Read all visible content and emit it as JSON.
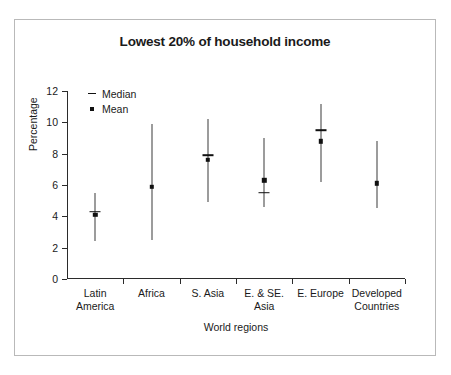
{
  "chart_data": {
    "type": "scatter",
    "title": "Lowest 20% of household income",
    "xlabel": "World regions",
    "ylabel": "Percentage",
    "ylim": [
      0,
      12
    ],
    "yticks": [
      0,
      2,
      4,
      6,
      8,
      10,
      12
    ],
    "grid": false,
    "legend_position": "top-left",
    "legend": [
      {
        "key": "dash",
        "label": "Median"
      },
      {
        "key": "dot",
        "label": "Mean"
      }
    ],
    "categories": [
      "Latin\nAmerica",
      "Africa",
      "S. Asia",
      "E. & SE.\nAsia",
      "E. Europe",
      "Developed\nCountries"
    ],
    "series": [
      {
        "name": "Range low",
        "values": [
          2.4,
          2.5,
          4.9,
          4.6,
          6.2,
          4.5
        ]
      },
      {
        "name": "Range high",
        "values": [
          5.5,
          9.9,
          10.2,
          9.0,
          11.2,
          8.8
        ]
      },
      {
        "name": "Median",
        "values": [
          4.3,
          null,
          7.9,
          5.5,
          9.5,
          null
        ]
      },
      {
        "name": "Mean",
        "values": [
          4.1,
          5.9,
          7.6,
          6.3,
          8.8,
          6.1
        ]
      }
    ],
    "colors": {
      "marker": "#111111",
      "axis": "#2b2b2b",
      "frame": "#b9b9b9",
      "background": "#ffffff"
    }
  }
}
